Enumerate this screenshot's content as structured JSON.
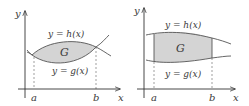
{
  "colors": {
    "axis": "#333333",
    "curve": "#555555",
    "region_fill": "#d4d4d4",
    "dashed": "#777777",
    "text": "#3a3a3a"
  },
  "panels": [
    {
      "id": "left",
      "axis_labels": {
        "x": "x",
        "y": "y"
      },
      "upper_curve_label": "y = h(x)",
      "lower_curve_label": "y = g(x)",
      "region_label": "G",
      "bounds": {
        "a": "a",
        "b": "b"
      }
    },
    {
      "id": "right",
      "axis_labels": {
        "x": "x",
        "y": "y"
      },
      "upper_curve_label": "y = h(x)",
      "lower_curve_label": "y = g(x)",
      "region_label": "G",
      "bounds": {
        "a": "a",
        "b": "b"
      }
    }
  ]
}
